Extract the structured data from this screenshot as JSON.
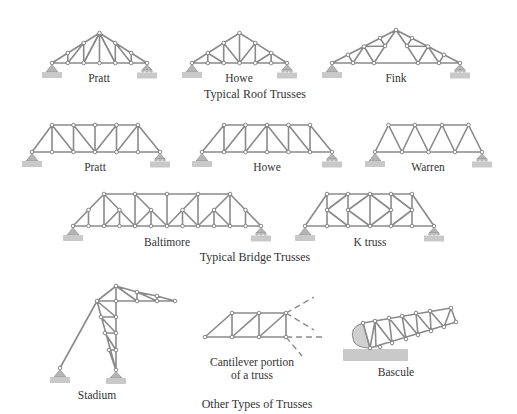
{
  "figure": {
    "sections": [
      {
        "caption": "Typical Roof Trusses",
        "trusses": [
          {
            "name": "Pratt"
          },
          {
            "name": "Howe"
          },
          {
            "name": "Fink"
          }
        ]
      },
      {
        "caption": "Typical Bridge Trusses",
        "trusses": [
          {
            "name": "Pratt"
          },
          {
            "name": "Howe"
          },
          {
            "name": "Warren"
          },
          {
            "name": "Baltimore"
          },
          {
            "name": "K truss"
          }
        ]
      },
      {
        "caption": "Other Types of Trusses",
        "trusses": [
          {
            "name": "Stadium"
          },
          {
            "name": "Cantilever portion of a truss",
            "line1": "Cantilever portion",
            "line2": "of a truss"
          },
          {
            "name": "Bascule"
          }
        ]
      }
    ],
    "colors": {
      "member": "#8a8a8a",
      "ground": "#c9c9c9",
      "text": "#333333"
    }
  }
}
